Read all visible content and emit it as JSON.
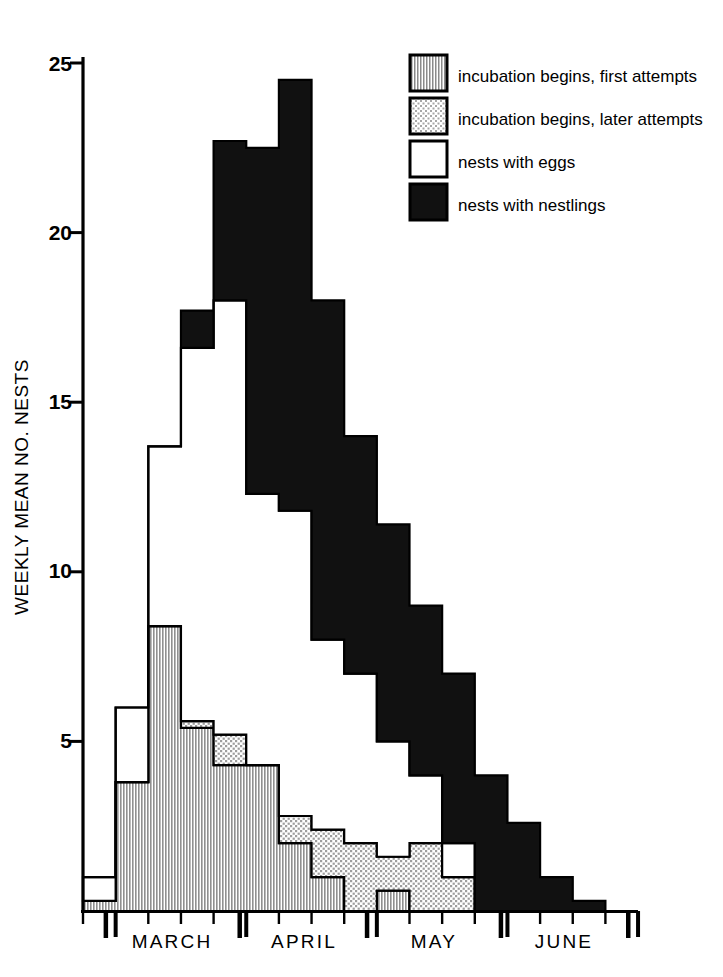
{
  "chart_data": {
    "type": "area",
    "title": "",
    "subtitle": "",
    "xlabel": "",
    "ylabel": "WEEKLY MEAN NO. NESTS",
    "ylim": [
      0,
      25
    ],
    "yticks": [
      5,
      10,
      15,
      20,
      25
    ],
    "ytick_labels": [
      "5",
      "10",
      "15",
      "20",
      "25"
    ],
    "grid": false,
    "stacked": true,
    "legend_position": "top-right",
    "x_axis_type": "weeks",
    "x_major_tick_labels": [
      "MARCH",
      "APRIL",
      "MAY",
      "JUNE"
    ],
    "x_note": "Weekly bins; major ticks mark month boundaries, minor ticks mark weeks",
    "categories": [
      "Mar wk1",
      "Mar wk2",
      "Mar wk3",
      "Mar wk4",
      "Apr wk1",
      "Apr wk2",
      "Apr wk3",
      "Apr wk4",
      "May wk1",
      "May wk2",
      "May wk3",
      "May wk4",
      "Jun wk1",
      "Jun wk2",
      "Jun wk3",
      "Jun wk4"
    ],
    "series": [
      {
        "name": "incubation begins, first attempts",
        "fill": "vertical-hatch",
        "values": [
          0.3,
          3.8,
          8.4,
          5.4,
          4.3,
          4.3,
          2.0,
          1.0,
          0.0,
          0.6,
          0.0,
          0.0,
          0.0,
          0.0,
          0.0,
          0.0
        ]
      },
      {
        "name": "incubation begins, later attempts",
        "fill": "dotted",
        "values": [
          0.0,
          0.0,
          0.0,
          0.2,
          0.9,
          0.0,
          0.8,
          1.4,
          2.0,
          1.0,
          2.0,
          1.0,
          0.0,
          0.0,
          0.0,
          0.0
        ]
      },
      {
        "name": "nests with eggs",
        "fill": "white",
        "values": [
          0.7,
          2.2,
          5.3,
          11.0,
          12.8,
          8.0,
          9.0,
          5.6,
          5.0,
          3.4,
          2.0,
          1.0,
          0.0,
          0.0,
          0.0,
          0.0
        ]
      },
      {
        "name": "nests with nestlings",
        "fill": "black",
        "values": [
          0.0,
          0.0,
          0.0,
          1.1,
          4.7,
          10.2,
          12.7,
          10.0,
          7.0,
          6.4,
          5.0,
          5.0,
          4.0,
          2.6,
          1.0,
          0.3
        ]
      }
    ],
    "stack_tops": {
      "first_attempts": [
        0.3,
        3.8,
        8.4,
        5.4,
        4.3,
        4.3,
        2.0,
        1.0,
        0.0,
        0.6,
        0.0,
        0.0,
        0.0,
        0.0,
        0.0,
        0.0
      ],
      "later_attempts": [
        0.3,
        3.8,
        8.4,
        5.6,
        5.2,
        4.3,
        2.8,
        2.4,
        2.0,
        1.6,
        2.0,
        1.0,
        0.0,
        0.0,
        0.0,
        0.0
      ],
      "eggs": [
        1.0,
        6.0,
        13.7,
        16.6,
        18.0,
        12.3,
        11.8,
        8.0,
        7.0,
        5.0,
        4.0,
        2.0,
        0.0,
        0.0,
        0.0,
        0.0
      ],
      "nestlings": [
        1.0,
        6.0,
        13.7,
        17.7,
        22.7,
        22.5,
        24.5,
        18.0,
        14.0,
        11.4,
        9.0,
        7.0,
        4.0,
        2.6,
        1.0,
        0.3
      ]
    }
  },
  "axis": {
    "y_title": "WEEKLY MEAN NO. NESTS",
    "y_ticks": [
      "25",
      "20",
      "15",
      "10",
      "5"
    ],
    "months": [
      "MARCH",
      "APRIL",
      "MAY",
      "JUNE"
    ]
  },
  "legend": {
    "items": [
      {
        "label": "incubation begins, first attempts",
        "swatch": "vertical-hatch-swatch"
      },
      {
        "label": "incubation begins, later attempts",
        "swatch": "dotted-swatch"
      },
      {
        "label": "nests with eggs",
        "swatch": "white-swatch"
      },
      {
        "label": "nests with nestlings",
        "swatch": "black-swatch"
      }
    ]
  },
  "colors": {
    "ink": "#000000",
    "paper": "#ffffff",
    "hatch_gray": "#9a9a9a",
    "dot_gray": "#b5b5b5"
  }
}
